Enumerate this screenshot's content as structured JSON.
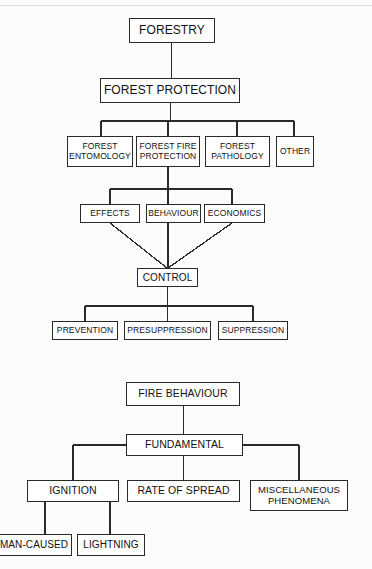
{
  "diagram": {
    "background_color": "#fcfcfb",
    "line_color": "#2a2a2a",
    "box_fill": "#ffffff",
    "text_color": "#111111"
  },
  "chart_top": {
    "nodes": {
      "forestry": "FORESTRY",
      "forest_protection": "FOREST PROTECTION",
      "forest_entomology": "FOREST\nENTOMOLOGY",
      "forest_fire_protection": "FOREST FIRE\nPROTECTION",
      "forest_pathology": "FOREST\nPATHOLOGY",
      "other": "OTHER",
      "effects": "EFFECTS",
      "behaviour": "BEHAVIOUR",
      "economics": "ECONOMICS",
      "control": "CONTROL",
      "prevention": "PREVENTION",
      "presuppression": "PRESUPPRESSION",
      "suppression": "SUPPRESSION"
    }
  },
  "chart_bottom": {
    "nodes": {
      "fire_behaviour": "FIRE BEHAVIOUR",
      "fundamental": "FUNDAMENTAL",
      "ignition": "IGNITION",
      "rate_of_spread": "RATE OF SPREAD",
      "miscellaneous_phenomena": "MISCELLANEOUS\nPHENOMENA",
      "man_caused": "MAN-CAUSED",
      "lightning": "LIGHTNING"
    }
  }
}
